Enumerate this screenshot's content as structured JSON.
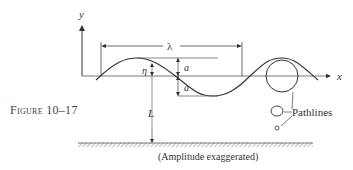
{
  "figure": {
    "caption": "Figure 10–17",
    "note": "(Amplitude exaggerated)"
  },
  "axes": {
    "y_label": "y",
    "x_label": "x"
  },
  "labels": {
    "wavelength": "λ",
    "elevation": "η",
    "amplitude_top": "a",
    "amplitude_bottom": "a",
    "depth": "L",
    "pathlines": "Pathlines"
  },
  "colors": {
    "line": "#3a3a3a",
    "hatch": "#6a6a6a",
    "background": "#ffffff"
  }
}
